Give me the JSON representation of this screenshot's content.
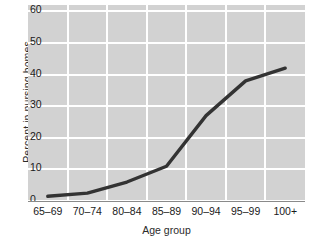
{
  "chart_data": {
    "type": "line",
    "title": "",
    "subtitle": "",
    "xlabel": "Age group",
    "ylabel": "Percent in nursing homes",
    "categories": [
      "65–69",
      "70–74",
      "80–84",
      "85–89",
      "90–94",
      "95–99",
      "100+"
    ],
    "values": [
      1.5,
      2.5,
      6,
      11,
      27,
      38,
      42
    ],
    "series": [
      {
        "name": "Percent in nursing homes",
        "values": [
          1.5,
          2.5,
          6,
          11,
          27,
          38,
          42
        ]
      }
    ],
    "ylim": [
      0,
      62
    ],
    "yticks": [
      0,
      10,
      20,
      30,
      40,
      50,
      60
    ],
    "ytick_labels": [
      "0",
      "10",
      "20",
      "30",
      "40",
      "50",
      "60"
    ],
    "grid": true,
    "grid_color": "#ffffff",
    "plot_background": "#d2d2d2",
    "line_color": "#333333",
    "legend": false,
    "legend_position": "none",
    "annotations": []
  },
  "figure": {
    "background": "#ffffff",
    "axis_color": "#8a8a8a",
    "text_color": "#1a1a1a"
  }
}
